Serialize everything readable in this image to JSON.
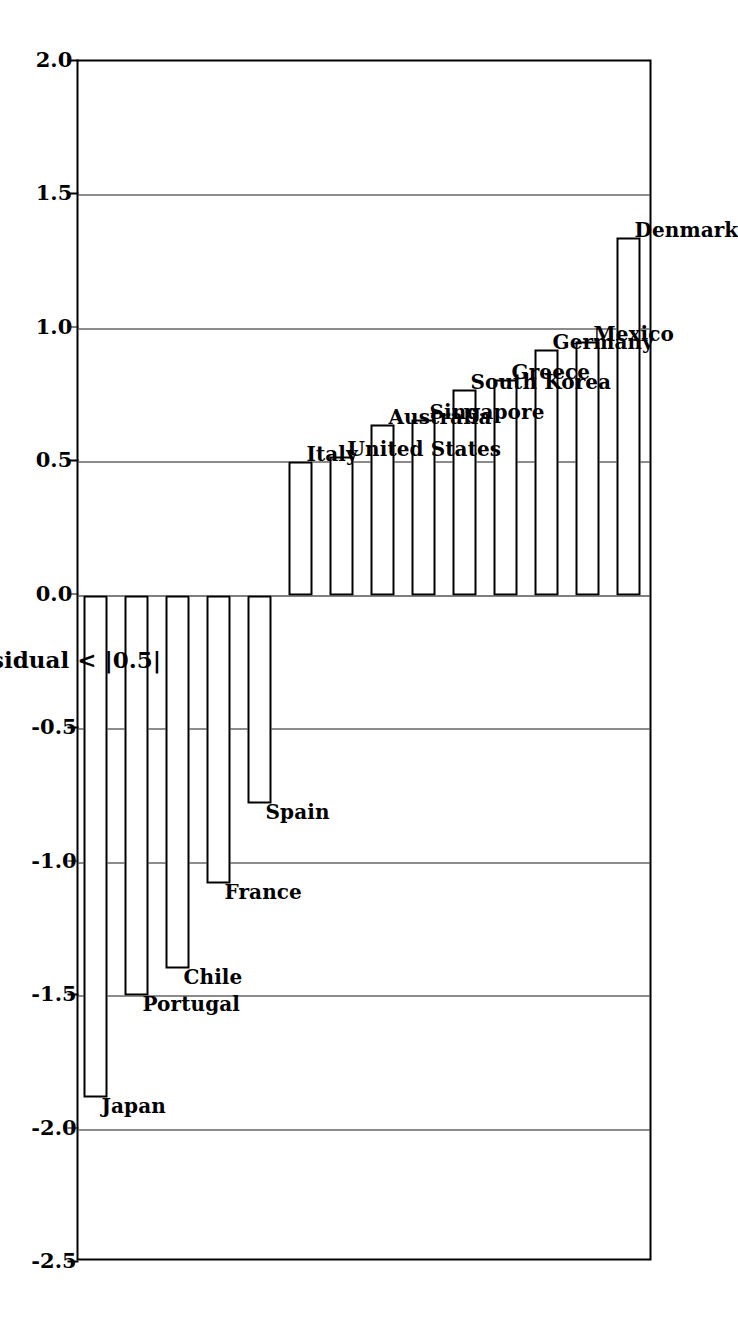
{
  "chart_data": {
    "type": "bar",
    "orientation": "horizontal",
    "title": "",
    "subtitle": "",
    "xlabel": "Standardized Residual < |0.5|",
    "ylabel": "",
    "xlim": [
      -2.5,
      2.0
    ],
    "ylim": null,
    "grid": true,
    "legend": null,
    "tick_labels": [
      "2.0",
      "1.5",
      "1.0",
      "0.5",
      "0.0",
      "-0.5",
      "-1.0",
      "-1.5",
      "-2.0",
      "-2.5"
    ],
    "tick_values": [
      2.0,
      1.5,
      1.0,
      0.5,
      0.0,
      -0.5,
      -1.0,
      -1.5,
      -2.0,
      -2.5
    ],
    "categories": [
      "Denmark",
      "Mexico",
      "Germany",
      "Greece",
      "South Korea",
      "Singapore",
      "Australia",
      "United States",
      "Italy",
      "Spain",
      "France",
      "Chile",
      "Portugal",
      "Japan"
    ],
    "values": [
      1.34,
      0.95,
      0.92,
      0.81,
      0.77,
      0.66,
      0.64,
      0.52,
      0.5,
      -0.78,
      -1.08,
      -1.4,
      -1.5,
      -1.88
    ],
    "bar_style": {
      "fill": "#ffffff",
      "edge": "#000000",
      "edge_width": 2.5
    }
  },
  "axis": {
    "label": "Standardized Residual < |0.5|"
  },
  "colors": {
    "background": "#ffffff",
    "foreground": "#000000",
    "gridline": "#1a1a1a"
  }
}
